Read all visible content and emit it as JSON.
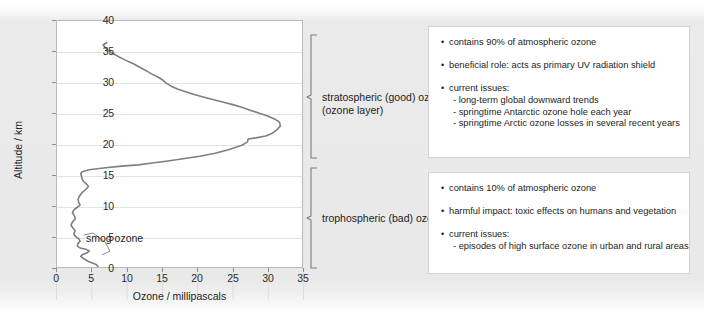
{
  "chart_data": {
    "type": "line",
    "title": "",
    "xlabel": "Ozone / millipascals",
    "ylabel": "Altitude / km",
    "xlim": [
      0,
      35
    ],
    "ylim": [
      0,
      40
    ],
    "xticks": [
      0,
      5,
      10,
      15,
      20,
      25,
      30,
      35
    ],
    "yticks": [
      0,
      5,
      10,
      15,
      20,
      25,
      30,
      35,
      40
    ],
    "grid": "horizontal",
    "legend": "none",
    "line_color": "#7f7f7f",
    "series": [
      {
        "name": "ozone vertical profile",
        "x": [
          5.9,
          5.6,
          4.5,
          3.9,
          3.4,
          3.6,
          4.3,
          4.6,
          4.1,
          3.3,
          2.9,
          3.0,
          3.3,
          3.1,
          2.6,
          2.4,
          2.6,
          2.3,
          2.0,
          2.2,
          2.6,
          2.5,
          2.2,
          2.4,
          3.0,
          3.3,
          3.1,
          3.0,
          3.2,
          3.5,
          4.1,
          4.5,
          4.2,
          3.8,
          3.6,
          3.5,
          3.4,
          3.6,
          4.6,
          6.6,
          9.2,
          11.6,
          13.6,
          15.6,
          18.0,
          20.4,
          22.6,
          24.6,
          26.4,
          27.2,
          27.3,
          28.4,
          29.8,
          30.7,
          31.3,
          31.9,
          31.8,
          31.2,
          30.2,
          28.9,
          27.6,
          26.3,
          25.1,
          23.8,
          22.4,
          21.0,
          19.7,
          18.6,
          17.3,
          16.3,
          15.6,
          15.1,
          14.4,
          13.5,
          12.9,
          12.3,
          11.6,
          11.0,
          10.2,
          9.5,
          8.8,
          8.2,
          7.5,
          7.0,
          6.6,
          7.1
        ],
        "y": [
          0.0,
          0.4,
          0.9,
          1.3,
          1.7,
          2.0,
          2.3,
          2.6,
          2.9,
          3.1,
          3.4,
          3.8,
          4.2,
          4.6,
          5.0,
          5.4,
          5.9,
          6.3,
          6.8,
          7.3,
          7.8,
          8.3,
          8.8,
          9.3,
          9.8,
          10.1,
          10.5,
          11.0,
          11.5,
          12.0,
          12.6,
          13.1,
          13.5,
          13.9,
          14.3,
          14.8,
          15.2,
          15.5,
          15.8,
          16.1,
          16.4,
          16.6,
          16.9,
          17.2,
          17.6,
          18.0,
          18.5,
          19.1,
          19.8,
          20.3,
          20.8,
          21.0,
          21.3,
          21.7,
          22.2,
          22.9,
          23.5,
          24.0,
          24.5,
          25.0,
          25.5,
          26.0,
          26.4,
          26.8,
          27.2,
          27.6,
          28.0,
          28.4,
          28.9,
          29.4,
          29.9,
          30.4,
          30.9,
          31.4,
          31.8,
          32.2,
          32.6,
          33.0,
          33.4,
          33.8,
          34.2,
          34.6,
          35.0,
          35.5,
          36.1,
          36.5
        ]
      }
    ],
    "annotations": [
      {
        "text": "smog ozone",
        "x": 8.0,
        "y": 4.0
      }
    ]
  },
  "axes": {
    "y_title": "Altitude / km",
    "x_title": "Ozone / millipascals",
    "y_tick_labels": [
      "40",
      "35",
      "30",
      "25",
      "20",
      "15",
      "10",
      "5",
      "0"
    ],
    "x_tick_labels": [
      "0",
      "5",
      "10",
      "15",
      "20",
      "25",
      "30",
      "35"
    ]
  },
  "annotation": {
    "smog_label": "smog ozone"
  },
  "layers": [
    {
      "id": "stratospheric",
      "bracket_label_line1": "stratospheric (good) ozone",
      "bracket_label_line2": "(ozone layer)",
      "bullets": [
        {
          "text": "contains 90% of atmospheric ozone",
          "sub": []
        },
        {
          "text": "beneficial role: acts as primary UV radiation shield",
          "sub": []
        },
        {
          "text": "current issues:",
          "sub": [
            "- long-term global downward trends",
            "- springtime Antarctic ozone hole each year",
            "- springtime Arctic ozone losses in several recent years"
          ]
        }
      ]
    },
    {
      "id": "tropospheric",
      "bracket_label_line1": "trophospheric (bad) ozone",
      "bracket_label_line2": "",
      "bullets": [
        {
          "text": "contains 10% of atmospheric ozone",
          "sub": []
        },
        {
          "text": "harmful impact: toxic effects on humans and vegetation",
          "sub": []
        },
        {
          "text": "current issues:",
          "sub": [
            "- episodes of high surface ozone in urban and rural areas"
          ]
        }
      ]
    }
  ],
  "bullet_glyph": "•",
  "colors": {
    "background": "#e9e9e9",
    "plot_background": "#ffffff",
    "curve": "#7f7f7f",
    "gridline": "#e3e3e3",
    "frame": "#b9b9b9",
    "box_border": "#d2d2d2",
    "text": "#1d1d1d"
  }
}
